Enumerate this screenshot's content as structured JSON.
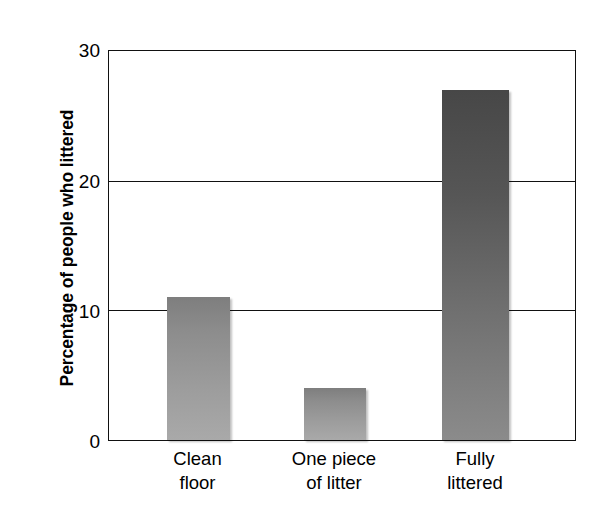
{
  "chart_data": {
    "type": "bar",
    "title": "",
    "subtitle": "",
    "xlabel": "",
    "ylabel": "Percentage of people who littered",
    "categories": [
      "Clean floor",
      "One piece of litter",
      "Fully littered"
    ],
    "category_lines": [
      [
        "Clean",
        "floor"
      ],
      [
        "One piece",
        "of litter"
      ],
      [
        "Fully",
        "littered"
      ]
    ],
    "values": [
      11,
      4,
      27
    ],
    "ylim": [
      0,
      30
    ],
    "yticks": [
      0,
      10,
      20,
      30
    ],
    "ytick_labels": [
      "0",
      "10",
      "20",
      "30"
    ],
    "xticks": [],
    "grid": "horizontal",
    "legend": "none",
    "bar_colors": [
      "#8d8d8d",
      "#8d8d8d",
      "#565656"
    ],
    "annotations": []
  },
  "axis": {
    "y_title": "Percentage of people who littered",
    "y_tick_0": "0",
    "y_tick_10": "10",
    "y_tick_20": "20",
    "y_tick_30": "30"
  },
  "categories": {
    "c0_line1": "Clean",
    "c0_line2": "floor",
    "c1_line1": "One piece",
    "c1_line2": "of litter",
    "c2_line1": "Fully",
    "c2_line2": "littered"
  },
  "colors": {
    "frame": "#111111",
    "gridline": "#111111",
    "bar_light_top": "#7e7e7e",
    "bar_light_bottom": "#a9a9a9",
    "bar_dark_top": "#474747",
    "bar_dark_bottom": "#8b8b8b",
    "background": "#ffffff"
  }
}
